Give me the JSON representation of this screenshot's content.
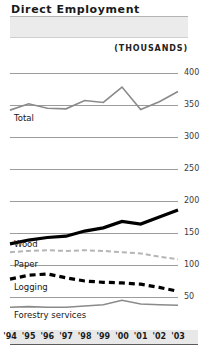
{
  "header": {
    "title": "Direct Employment",
    "units": "(THOUSANDS)"
  },
  "chart_data": {
    "type": "line",
    "title": "Direct Employment",
    "subtitle": "(THOUSANDS)",
    "xlabel": "",
    "ylabel": "(THOUSANDS)",
    "grid": true,
    "legend": "inline-labels",
    "ylim": [
      0,
      420
    ],
    "yticks": [
      400,
      350,
      300,
      250,
      200,
      150,
      100,
      50
    ],
    "categories": [
      "'94",
      "'95",
      "'96",
      "'97",
      "'98",
      "'99",
      "'00",
      "'01",
      "'02",
      "'03"
    ],
    "series": [
      {
        "name": "Total",
        "label": "Total",
        "color": "#8a8a8a",
        "style": "solid-thin",
        "values": [
          342,
          352,
          345,
          344,
          357,
          354,
          378,
          343,
          355,
          371
        ]
      },
      {
        "name": "Wood",
        "label": "Wood",
        "color": "#000000",
        "style": "solid-bold",
        "values": [
          133,
          139,
          143,
          145,
          153,
          158,
          168,
          164,
          175,
          186
        ]
      },
      {
        "name": "Paper",
        "label": "Paper",
        "color": "#b5b5b5",
        "style": "dashed-thin",
        "values": [
          120,
          122,
          123,
          122,
          123,
          122,
          120,
          118,
          113,
          109
        ]
      },
      {
        "name": "Logging",
        "label": "Logging",
        "color": "#000000",
        "style": "dashed-bold",
        "values": [
          78,
          84,
          86,
          80,
          75,
          73,
          72,
          70,
          65,
          59
        ]
      },
      {
        "name": "Forestry services",
        "label": "Forestry services",
        "color": "#8a8a8a",
        "style": "solid-thin",
        "values": [
          34,
          35,
          34,
          34,
          36,
          38,
          45,
          39,
          38,
          37
        ]
      }
    ]
  },
  "yaxis": {
    "ticks": [
      {
        "value": "400",
        "y": 73
      },
      {
        "value": "350",
        "y": 105
      },
      {
        "value": "300",
        "y": 137
      },
      {
        "value": "250",
        "y": 169
      },
      {
        "value": "200",
        "y": 201
      },
      {
        "value": "150",
        "y": 233
      },
      {
        "value": "100",
        "y": 265
      },
      {
        "value": "50",
        "y": 297
      }
    ]
  },
  "xaxis": {
    "labels": [
      "'94",
      "'95",
      "'96",
      "'97",
      "'98",
      "'99",
      "'00",
      "'01",
      "'02",
      "'03"
    ]
  },
  "labels": {
    "total": "Total",
    "wood": "Wood",
    "paper": "Paper",
    "logging": "Logging",
    "forestry_services": "Forestry services"
  }
}
